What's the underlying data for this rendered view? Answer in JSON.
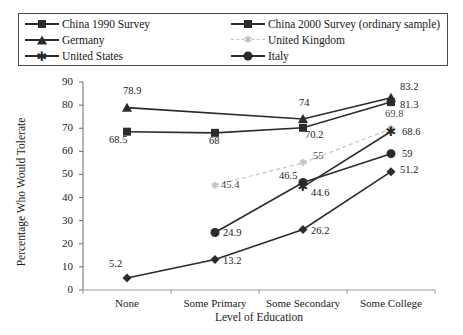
{
  "chart_data": {
    "type": "line",
    "title": "",
    "xlabel": "Level of Education",
    "ylabel": "Percentage Who Would Tolerate",
    "categories": [
      "None",
      "Some Primary",
      "Some Secondary",
      "Some College"
    ],
    "ylim": [
      0,
      90
    ],
    "yticks": [
      0,
      10,
      20,
      30,
      40,
      50,
      60,
      70,
      80,
      90
    ],
    "grid": false,
    "legend_position": "top",
    "series": [
      {
        "name": "China 1990 Survey",
        "marker": "diamond",
        "color": "#2b2b2b",
        "style": "solid",
        "values": [
          5.2,
          13.2,
          26.2,
          51.2
        ],
        "labels": [
          "5.2",
          "13.2",
          "26.2",
          "51.2"
        ]
      },
      {
        "name": "China 2000 Survey (ordinary sample)",
        "marker": "square",
        "color": "#2b2b2b",
        "style": "solid",
        "values": [
          68.5,
          68,
          70.2,
          81.3
        ],
        "labels": [
          "68.5",
          "68",
          "70.2",
          "81.3"
        ]
      },
      {
        "name": "Germany",
        "marker": "triangle",
        "color": "#2b2b2b",
        "style": "solid",
        "values": [
          78.9,
          null,
          74,
          83.2
        ],
        "labels": [
          "78.9",
          "",
          "74",
          "83.2"
        ]
      },
      {
        "name": "United Kingdom",
        "marker": "tick",
        "color": "#c3c3c3",
        "style": "dashed",
        "values": [
          null,
          45.4,
          55,
          69.8
        ],
        "labels": [
          "",
          "45.4",
          "55",
          "69.8"
        ]
      },
      {
        "name": "United States",
        "marker": "star",
        "color": "#2b2b2b",
        "style": "solid",
        "values": [
          null,
          null,
          44.6,
          68.6
        ],
        "labels": [
          "",
          "",
          "44.6",
          "68.6"
        ]
      },
      {
        "name": "Italy",
        "marker": "circle",
        "color": "#2b2b2b",
        "style": "solid",
        "values": [
          null,
          24.9,
          46.5,
          59
        ],
        "labels": [
          "",
          "24.9",
          "46.5",
          "59"
        ]
      }
    ]
  },
  "legend": {
    "left_column": [
      {
        "label": "China 1990 Survey",
        "marker": "diamond"
      },
      {
        "label": "Germany",
        "marker": "triangle"
      },
      {
        "label": "United States",
        "marker": "star"
      }
    ],
    "right_column": [
      {
        "label": "China 2000 Survey (ordinary sample)",
        "marker": "square"
      },
      {
        "label": "United Kingdom",
        "marker": "tick"
      },
      {
        "label": "Italy",
        "marker": "circle"
      }
    ]
  },
  "axes": {
    "y_title": "Percentage Who Would Tolerate",
    "x_title": "Level of Education",
    "y_ticks": [
      "0",
      "10",
      "20",
      "30",
      "40",
      "50",
      "60",
      "70",
      "80",
      "90"
    ],
    "x_ticks": [
      "None",
      "Some Primary",
      "Some Secondary",
      "Some College"
    ]
  }
}
